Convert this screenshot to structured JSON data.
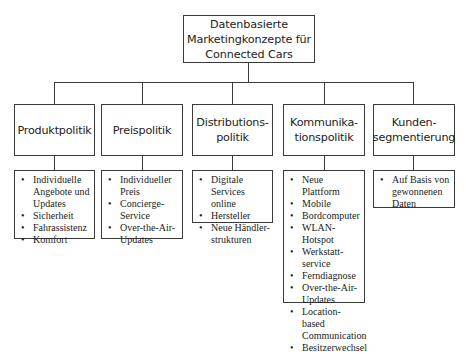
{
  "root": {
    "label": "Datenbasierte Marketingkonzepte für Connected Cars",
    "lines": [
      "Datenbasierte",
      "Marketingkonzepte für",
      "Connected Cars"
    ]
  },
  "categories": [
    {
      "id": "produktpolitik",
      "lines": [
        "Produktpolitik"
      ],
      "items": [
        "Individuelle Angebote und Updates",
        "Sicherheit",
        "Fahrassistenz",
        "Komfort"
      ]
    },
    {
      "id": "preispolitik",
      "lines": [
        "Preispolitik"
      ],
      "items": [
        "Individueller Preis",
        "Concierge-Service",
        "Over-the-Air-Updates"
      ]
    },
    {
      "id": "distributionspolitik",
      "lines": [
        "Distributions-",
        "politik"
      ],
      "items": [
        "Digitale Services online",
        "Hersteller",
        "Neue Händler-strukturen"
      ]
    },
    {
      "id": "kommunikationspolitik",
      "lines": [
        "Kommunika-",
        "tionspolitik"
      ],
      "items": [
        "Neue Plattform",
        "Mobile",
        "Bordcomputer",
        "WLAN-Hotspot",
        "Werkstatt-service",
        "Ferndiagnose",
        "Over-the-Air-Updates",
        "Location-based Communication",
        "Besitzerwechsel"
      ]
    },
    {
      "id": "kundensegmentierung",
      "lines": [
        "Kunden-",
        "segmentierung"
      ],
      "items": [
        "Auf Basis von gewonnenen Daten"
      ]
    }
  ],
  "colors": {
    "line": "#3a3a3a",
    "text": "#222222",
    "background": "#ffffff"
  }
}
